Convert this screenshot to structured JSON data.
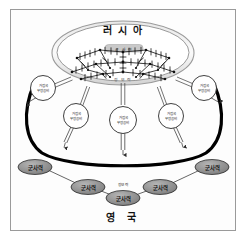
{
  "diagram": {
    "top_country_label": "러 시 아",
    "bottom_country_label": "영  국",
    "russia_inner_box_label": "군  사  력",
    "russia_network_sublabel": "정 보 력",
    "center_note_label": "정보력",
    "upper_nodes": [
      {
        "id": "node-left-outer",
        "line1": "거점국",
        "line2": "무장공비"
      },
      {
        "id": "node-left-inner",
        "line1": "거점국",
        "line2": "무장공비"
      },
      {
        "id": "node-center",
        "line1": "거점국",
        "line2": "무장공비"
      },
      {
        "id": "node-right-inner",
        "line1": "거점국",
        "line2": "무장공비"
      },
      {
        "id": "node-right-outer",
        "line1": "거점국",
        "line2": "무장공비"
      }
    ],
    "lower_ovals": [
      {
        "id": "oval-far-left",
        "label": "군사력"
      },
      {
        "id": "oval-left",
        "label": "군사력"
      },
      {
        "id": "oval-center",
        "label": "군사력"
      },
      {
        "id": "oval-right",
        "label": "군사력"
      },
      {
        "id": "oval-far-right",
        "label": "군사력"
      }
    ],
    "colors": {
      "frame_border": "#9a9a9a",
      "ellipse_stroke": "#8d8d8d",
      "ellipse_fill": "#ffffff",
      "grey_box_fill": "#c9c9c9",
      "node_fill": "#ffffff",
      "node_stroke": "#2a2a2a",
      "oval_fill": "#8f8f8f",
      "oval_stroke": "#2a2a2a",
      "boundary_curve": "#000000",
      "connector": "#3a3a3a"
    }
  }
}
